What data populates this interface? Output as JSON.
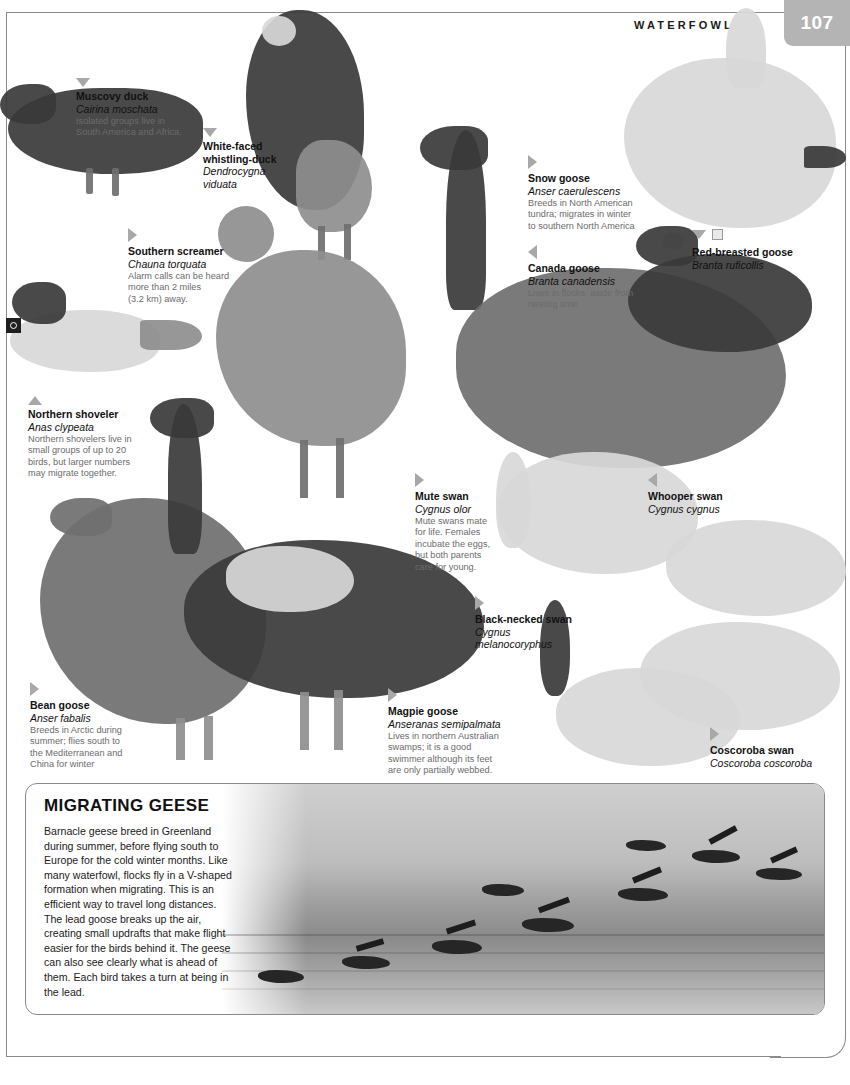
{
  "header": {
    "running_head": "WATERFOWL",
    "page_number": "107"
  },
  "species": [
    {
      "key": "muscovy-duck",
      "common": "Muscovy duck",
      "scientific": "Cairina moschata",
      "description": "Isolated groups live in\nSouth America and Africa.",
      "marker": "down"
    },
    {
      "key": "white-faced-whistling-duck",
      "common": "White-faced\nwhistling-duck",
      "scientific": "Dendrocygna\nviduata",
      "description": "",
      "marker": "down"
    },
    {
      "key": "southern-screamer",
      "common": "Southern screamer",
      "scientific": "Chauna torquata",
      "description": "Alarm calls can be heard\nmore than 2 miles\n(3.2 km) away.",
      "marker": "right"
    },
    {
      "key": "northern-shoveler",
      "common": "Northern shoveler",
      "scientific": "Anas clypeata",
      "description": "Northern shovelers live in\nsmall groups of up to 20\nbirds, but larger numbers\nmay migrate together.",
      "marker": "up"
    },
    {
      "key": "snow-goose",
      "common": "Snow goose",
      "scientific": "Anser caerulescens",
      "description": "Breeds in North American\ntundra; migrates in winter\nto southern North America",
      "marker": "right"
    },
    {
      "key": "canada-goose",
      "common": "Canada goose",
      "scientific": "Branta canadensis",
      "description": "Lives in flocks, aside from\nnesting time",
      "marker": "left"
    },
    {
      "key": "red-breasted-goose",
      "common": "Red-breasted goose",
      "scientific": "Branta ruficollis",
      "description": "",
      "marker": "down"
    },
    {
      "key": "mute-swan",
      "common": "Mute swan",
      "scientific": "Cygnus olor",
      "description": "Mute swans mate\nfor life. Females\nincubate the eggs,\nbut both parents\ncare for young.",
      "marker": "right"
    },
    {
      "key": "whooper-swan",
      "common": "Whooper swan",
      "scientific": "Cygnus cygnus",
      "description": "",
      "marker": "left"
    },
    {
      "key": "black-necked-swan",
      "common": "Black-necked swan",
      "scientific": "Cygnus\nmelanocoryphus",
      "description": "",
      "marker": "right"
    },
    {
      "key": "bean-goose",
      "common": "Bean goose",
      "scientific": "Anser fabalis",
      "description": "Breeds in Arctic during\nsummer; flies south to\nthe Mediterranean and\nChina for winter",
      "marker": "right"
    },
    {
      "key": "magpie-goose",
      "common": "Magpie goose",
      "scientific": "Anseranas semipalmata",
      "description": "Lives in northern Australian\nswamps; it is a good\nswimmer although its feet\nare only partially webbed.",
      "marker": "right"
    },
    {
      "key": "coscoroba-swan",
      "common": "Coscoroba swan",
      "scientific": "Coscoroba coscoroba",
      "description": "",
      "marker": "right"
    }
  ],
  "feature": {
    "title": "MIGRATING GEESE",
    "body": "Barnacle geese breed in Greenland during summer, before flying south to Europe for the cold winter months. Like many waterfowl, flocks fly in a V-shaped formation when migrating. This is an efficient way to travel long distances. The lead goose breaks up the air, creating small updrafts that make flight easier for the birds behind it. The geese can also see clearly what is ahead of them. Each bird takes a turn at being in the lead."
  },
  "colors": {
    "folio_background": "#b4b4b4",
    "frame_rule": "#8a8a8a",
    "body_text": "#111111",
    "description_text": "#6b6b6b"
  }
}
